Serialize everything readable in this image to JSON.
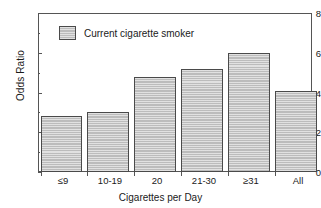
{
  "chart_data": {
    "type": "bar",
    "title": "",
    "subtitle": "",
    "xlabel": "Cigarettes per Day",
    "ylabel": "Odds Ratio",
    "categories": [
      "≤9",
      "10-19",
      "20",
      "21-30",
      "≥31",
      "All"
    ],
    "values": [
      2.8,
      3.0,
      4.8,
      5.2,
      6.0,
      4.1
    ],
    "series": [
      {
        "name": "Current cigarette smoker",
        "values": [
          2.8,
          3.0,
          4.8,
          5.2,
          6.0,
          4.1
        ]
      }
    ],
    "ylim": [
      0,
      8
    ],
    "yticks": [
      0,
      2,
      4,
      6,
      8
    ],
    "ytick_labels": [
      "0",
      "2",
      "4",
      "6",
      "8"
    ],
    "yminor_ticks": [
      1,
      3,
      5,
      7
    ],
    "grid": false,
    "legend": {
      "position": "top-left-inside",
      "entries": [
        {
          "label": "Current cigarette smoker",
          "color": "#bcbcbc"
        }
      ]
    },
    "colors": {
      "bar_fill": "#bcbcbc",
      "bar_edge": "#4a4a4a",
      "axis": "#555555",
      "text": "#1a1a1a",
      "background": "#ffffff"
    }
  }
}
